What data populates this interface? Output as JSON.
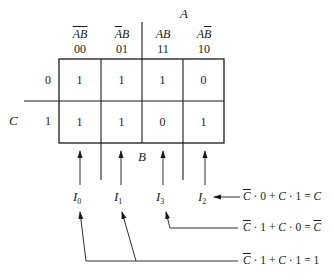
{
  "kmap": {
    "var_A": "A",
    "var_B": "B",
    "var_C": "C",
    "columns": [
      {
        "header_parts": [
          {
            "t": "A",
            "ov": true
          },
          {
            "t": "B",
            "ov": true
          }
        ],
        "code": "00"
      },
      {
        "header_parts": [
          {
            "t": "A",
            "ov": true
          },
          {
            "t": "B",
            "ov": false
          }
        ],
        "code": "01"
      },
      {
        "header_parts": [
          {
            "t": "A",
            "ov": false
          },
          {
            "t": "B",
            "ov": false
          }
        ],
        "code": "11"
      },
      {
        "header_parts": [
          {
            "t": "A",
            "ov": false
          },
          {
            "t": "B",
            "ov": true
          }
        ],
        "code": "10"
      }
    ],
    "rows": [
      {
        "label": "0",
        "cells": [
          "1",
          "1",
          "1",
          "0"
        ]
      },
      {
        "label": "1",
        "cells": [
          "1",
          "1",
          "0",
          "1"
        ]
      }
    ]
  },
  "inputs": [
    {
      "name": "I",
      "sub": "0"
    },
    {
      "name": "I",
      "sub": "1"
    },
    {
      "name": "I",
      "sub": "3"
    },
    {
      "name": "I",
      "sub": "2"
    }
  ],
  "equations": [
    {
      "id": "eq-I2",
      "text_parts": [
        {
          "t": "C",
          "ov": true,
          "v": true
        },
        {
          "t": " · 0 + "
        },
        {
          "t": "C",
          "v": true
        },
        {
          "t": " · 1 = "
        },
        {
          "t": "C",
          "v": true
        }
      ]
    },
    {
      "id": "eq-I3",
      "text_parts": [
        {
          "t": "C",
          "ov": true,
          "v": true
        },
        {
          "t": " · 1 + "
        },
        {
          "t": "C",
          "v": true
        },
        {
          "t": " · 0 = "
        },
        {
          "t": "C",
          "ov": true,
          "v": true
        }
      ]
    },
    {
      "id": "eq-I0-I1",
      "text_parts": [
        {
          "t": "C",
          "ov": true,
          "v": true
        },
        {
          "t": " · 1 + "
        },
        {
          "t": "C",
          "v": true
        },
        {
          "t": " · 1 = 1"
        }
      ]
    }
  ],
  "style": {
    "ink": "#1a1a1a",
    "background": "#ffffff"
  }
}
